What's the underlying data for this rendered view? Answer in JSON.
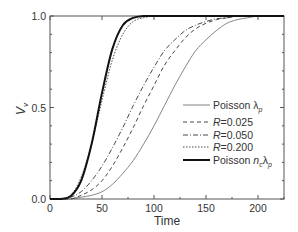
{
  "panel_fragment": "l",
  "chart_data": {
    "type": "line",
    "title": "",
    "xlabel": "Time",
    "ylabel": "V_v",
    "ylabel_main": "V",
    "ylabel_sub": "v",
    "xlim": [
      0,
      225
    ],
    "ylim": [
      0.0,
      1.0
    ],
    "grid": false,
    "legend_position": "center-right",
    "x_ticks": [
      0,
      50,
      100,
      150,
      200
    ],
    "x_tick_labels": [
      "0",
      "50",
      "100",
      "150",
      "200"
    ],
    "x_minor_ticks": [
      25,
      75,
      125,
      175,
      225
    ],
    "y_ticks": [
      0.0,
      0.5,
      1.0
    ],
    "y_tick_labels": [
      "0.0",
      "0.5",
      "1.0"
    ],
    "y_minor_ticks": [
      0.1,
      0.2,
      0.3,
      0.4,
      0.6,
      0.7,
      0.8,
      0.9
    ],
    "x": [
      0,
      10,
      20,
      30,
      40,
      50,
      60,
      70,
      80,
      90,
      100,
      110,
      120,
      130,
      140,
      150,
      160,
      170,
      180,
      190,
      200,
      210,
      220,
      225
    ],
    "series": [
      {
        "name": "Poisson λp",
        "label_main": "Poisson ",
        "label_greek": "λ",
        "label_sub": "p",
        "style": "thin-solid",
        "values": [
          0,
          0,
          0,
          0.01,
          0.02,
          0.04,
          0.08,
          0.14,
          0.21,
          0.3,
          0.4,
          0.51,
          0.62,
          0.72,
          0.81,
          0.87,
          0.92,
          0.96,
          0.98,
          0.99,
          1.0,
          1.0,
          1.0,
          1.0
        ]
      },
      {
        "name": "R=0.025",
        "label_main": "R",
        "label_rest": "=0.025",
        "style": "dashed",
        "values": [
          0,
          0,
          0,
          0.02,
          0.05,
          0.1,
          0.18,
          0.28,
          0.39,
          0.51,
          0.62,
          0.73,
          0.81,
          0.88,
          0.93,
          0.96,
          0.98,
          0.99,
          1.0,
          1.0,
          1.0,
          1.0,
          1.0,
          1.0
        ]
      },
      {
        "name": "R=0.050",
        "label_main": "R",
        "label_rest": "=0.050",
        "style": "dash-dot",
        "values": [
          0,
          0,
          0.01,
          0.04,
          0.1,
          0.18,
          0.28,
          0.39,
          0.51,
          0.62,
          0.72,
          0.81,
          0.87,
          0.92,
          0.95,
          0.97,
          0.985,
          0.99,
          1.0,
          1.0,
          1.0,
          1.0,
          1.0,
          1.0
        ]
      },
      {
        "name": "R=0.200",
        "label_main": "R",
        "label_rest": "=0.200",
        "style": "dotted",
        "values": [
          0,
          0,
          0.02,
          0.12,
          0.3,
          0.54,
          0.76,
          0.9,
          0.97,
          0.99,
          1.0,
          1.0,
          1.0,
          1.0,
          1.0,
          1.0,
          1.0,
          1.0,
          1.0,
          1.0,
          1.0,
          1.0,
          1.0,
          1.0
        ]
      },
      {
        "name": "Poisson ncλp",
        "label_main": "Poisson ",
        "label_n": "n",
        "label_nsub": "c",
        "label_greek": "λ",
        "label_sub": "p",
        "style": "thick-solid",
        "values": [
          0,
          0,
          0.016,
          0.1,
          0.3,
          0.58,
          0.82,
          0.95,
          0.99,
          1.0,
          1.0,
          1.0,
          1.0,
          1.0,
          1.0,
          1.0,
          1.0,
          1.0,
          1.0,
          1.0,
          1.0,
          1.0,
          1.0,
          1.0
        ]
      }
    ]
  }
}
